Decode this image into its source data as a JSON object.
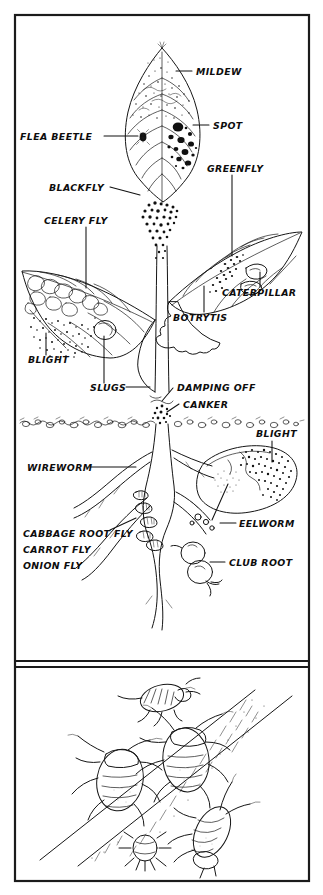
{
  "figure": {
    "type": "labelled-botanical-diagram",
    "title_visible": false,
    "panels": [
      {
        "name": "plant-pests-and-diseases-panel",
        "description": "Line drawing of a plant showing leaves, stem, soil line, roots and tubers with pest and disease call-outs"
      },
      {
        "name": "aphid-detail-panel",
        "description": "Close-up line drawing of five aphids on a plant stem"
      }
    ]
  },
  "labels": {
    "mildew": "MILDEW",
    "spot": "SPOT",
    "greenfly": "GREENFLY",
    "flea_beetle": "FLEA BEETLE",
    "blackfly": "BLACKFLY",
    "celery_fly": "CELERY FLY",
    "caterpillar": "CATERPILLAR",
    "botrytis": "BOTRYTIS",
    "blight_leaf": "BLIGHT",
    "slugs": "SLUGS",
    "damping_off": "DAMPING OFF",
    "canker": "CANKER",
    "blight_tuber": "BLIGHT",
    "wireworm": "WIREWORM",
    "cabbage_root_fly": "CABBAGE ROOT FLY",
    "carrot_fly": "CARROT FLY",
    "onion_fly": "ONION FLY",
    "eelworm": "EELWORM",
    "club_root": "CLUB ROOT"
  },
  "label_list": [
    {
      "id": "mildew",
      "text": "MILDEW",
      "side": "right",
      "x": 196,
      "y": 74
    },
    {
      "id": "spot",
      "text": "SPOT",
      "side": "right",
      "x": 213,
      "y": 128
    },
    {
      "id": "greenfly",
      "text": "GREENFLY",
      "side": "right",
      "x": 212,
      "y": 169
    },
    {
      "id": "flea-beetle",
      "text": "FLEA BEETLE",
      "side": "left",
      "x": 21,
      "y": 139
    },
    {
      "id": "blackfly",
      "text": "BLACKFLY",
      "side": "left",
      "x": 50,
      "y": 190
    },
    {
      "id": "celery-fly",
      "text": "CELERY FLY",
      "side": "left",
      "x": 44,
      "y": 221
    },
    {
      "id": "caterpillar",
      "text": "CATERPILLAR",
      "side": "right",
      "x": 226,
      "y": 293
    },
    {
      "id": "botrytis",
      "text": "BOTRYTIS",
      "side": "right",
      "x": 176,
      "y": 318
    },
    {
      "id": "blight-leaf",
      "text": "BLIGHT",
      "side": "left",
      "x": 31,
      "y": 361
    },
    {
      "id": "slugs",
      "text": "SLUGS",
      "side": "left",
      "x": 92,
      "y": 389
    },
    {
      "id": "damping-off",
      "text": "DAMPING OFF",
      "side": "right",
      "x": 177,
      "y": 390
    },
    {
      "id": "canker",
      "text": "CANKER",
      "side": "right",
      "x": 183,
      "y": 406
    },
    {
      "id": "blight-tuber",
      "text": "BLIGHT",
      "side": "right",
      "x": 261,
      "y": 434
    },
    {
      "id": "wireworm",
      "text": "WIREWORM",
      "side": "left",
      "x": 29,
      "y": 470
    },
    {
      "id": "cabbage-root-fly",
      "text": "CABBAGE ROOT FLY",
      "side": "left",
      "x": 24,
      "y": 534
    },
    {
      "id": "carrot-fly",
      "text": "CARROT FLY",
      "side": "left",
      "x": 24,
      "y": 550
    },
    {
      "id": "onion-fly",
      "text": "ONION FLY",
      "side": "left",
      "x": 24,
      "y": 566
    },
    {
      "id": "eelworm",
      "text": "EELWORM",
      "side": "right",
      "x": 224,
      "y": 526
    },
    {
      "id": "club-root",
      "text": "CLUB ROOT",
      "side": "right",
      "x": 229,
      "y": 565
    }
  ],
  "colors": {
    "ink": "#151515",
    "paper": "#ffffff",
    "frame": "#1b1b1b"
  }
}
